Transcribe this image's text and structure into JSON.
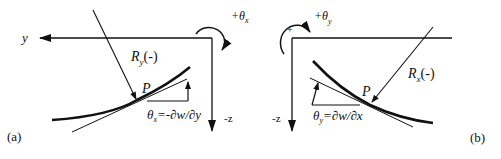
{
  "diagram": {
    "panel_a": {
      "caption": "(a)",
      "axis_horizontal_label": "y",
      "axis_vertical_label": "-z",
      "rotation_label_prefix": "+θ",
      "rotation_label_sub": "x",
      "radius_label_main": "R",
      "radius_label_sub": "y",
      "radius_label_suffix": "(-)",
      "point_label": "P",
      "slope_label_main": "θ",
      "slope_label_sub": "x",
      "slope_label_rest": "=-∂w/∂y"
    },
    "panel_b": {
      "caption": "(b)",
      "axis_vertical_label": "-z",
      "rotation_label_prefix": "+θ",
      "rotation_label_sub": "y",
      "rotation_sign": "+",
      "radius_label_main": "R",
      "radius_label_sub": "x",
      "radius_label_suffix": "(-)",
      "point_label": "P",
      "slope_label_main": "θ",
      "slope_label_sub": "y",
      "slope_label_rest": "=∂w/∂x"
    }
  }
}
